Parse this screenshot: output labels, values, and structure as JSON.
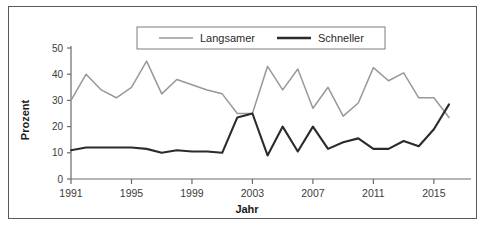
{
  "chart_data": {
    "type": "line",
    "title": "",
    "subtitle": "",
    "xlabel": "Jahr",
    "ylabel": "Prozent",
    "xlim": [
      1991,
      2016
    ],
    "ylim": [
      0,
      50
    ],
    "yticks": [
      0,
      10,
      20,
      30,
      40,
      50
    ],
    "xticks": [
      1991,
      1995,
      1999,
      2003,
      2007,
      2011,
      2015
    ],
    "xtick_labels": [
      "1991",
      "1995",
      "1999",
      "2003",
      "2007",
      "2011",
      "2015"
    ],
    "ytick_labels": [
      "0",
      "10",
      "20",
      "30",
      "40",
      "50"
    ],
    "grid": false,
    "legend_position": "top-center",
    "x": [
      1991,
      1992,
      1993,
      1994,
      1995,
      1996,
      1997,
      1998,
      1999,
      2000,
      2001,
      2002,
      2003,
      2004,
      2005,
      2006,
      2007,
      2008,
      2009,
      2010,
      2011,
      2012,
      2013,
      2014,
      2015,
      2016
    ],
    "series": [
      {
        "name": "Langsamer",
        "color": "#989898",
        "values": [
          30,
          40,
          34,
          31,
          35,
          45,
          32.5,
          38,
          36,
          34,
          32.5,
          25,
          25,
          43,
          34,
          42,
          27,
          35,
          24,
          29,
          42.5,
          37.5,
          40.5,
          31,
          31,
          23.5
        ]
      },
      {
        "name": "Schneller",
        "color": "#2b2b2b",
        "values": [
          11,
          12,
          12,
          12,
          12,
          11.5,
          10,
          11,
          10.5,
          10.5,
          10,
          23.5,
          25,
          9,
          20,
          10.5,
          20,
          11.5,
          14,
          15.5,
          11.5,
          11.5,
          14.5,
          12.5,
          19,
          28.5
        ]
      }
    ]
  },
  "legend": {
    "items": [
      {
        "label": "Langsamer",
        "color": "#989898"
      },
      {
        "label": "Schneller",
        "color": "#2b2b2b"
      }
    ]
  },
  "axes": {
    "y_title": "Prozent",
    "x_title": "Jahr"
  }
}
